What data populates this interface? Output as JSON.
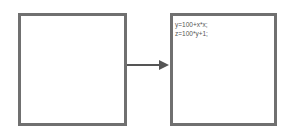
{
  "diagram": {
    "left_box": {
      "content": ""
    },
    "right_box": {
      "lines": [
        "y=100+x*x;",
        "z=100*y+1;"
      ]
    },
    "arrow": {
      "direction": "left-to-right"
    },
    "colors": {
      "border": "#707070",
      "arrow": "#555555",
      "text": "#555555"
    }
  }
}
